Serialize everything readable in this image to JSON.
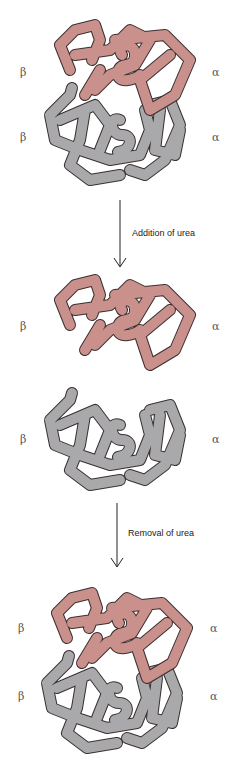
{
  "diagram": {
    "colors": {
      "alpha_subunit": "#c9908c",
      "beta_subunit": "#a9a9ab",
      "outline": "#3a3030",
      "arrow": "#222222"
    },
    "stages": [
      {
        "name": "tetramer",
        "labels": {
          "top_left": "β",
          "top_right": "α",
          "bottom_left": "β",
          "bottom_right": "α"
        }
      },
      {
        "name": "dissociated-dimers",
        "labels": {
          "top_left": "β",
          "top_right": "α",
          "bottom_left": "β",
          "bottom_right": "α"
        }
      },
      {
        "name": "reassociated-tetramer",
        "labels": {
          "top_left": "β",
          "top_right": "α",
          "bottom_left": "β",
          "bottom_right": "α"
        }
      }
    ],
    "steps": [
      {
        "label": "Addition of urea"
      },
      {
        "label": "Removal of urea"
      }
    ]
  }
}
